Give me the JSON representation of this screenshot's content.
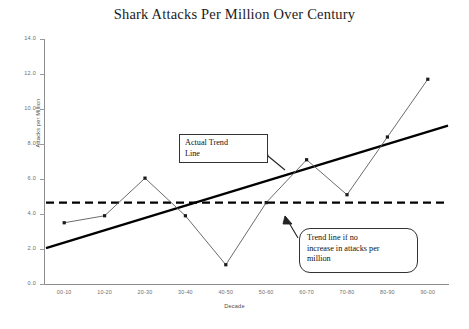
{
  "chart_data": {
    "type": "line",
    "title": "Shark Attacks Per Million Over Century",
    "xlabel": "Decade",
    "ylabel": "Attacks per Million",
    "categories": [
      "00-10",
      "10-20",
      "20-30",
      "30-40",
      "40-50",
      "50-60",
      "60-70",
      "70-80",
      "80-90",
      "90-00"
    ],
    "ylim": [
      0.0,
      14.0
    ],
    "ytick_labels": [
      "0.0",
      "2.0",
      "4.0",
      "6.0",
      "8.0",
      "10.0",
      "12.0",
      "14.0"
    ],
    "ytick_values": [
      0,
      2,
      4,
      6,
      8,
      10,
      12,
      14
    ],
    "grid": false,
    "legend": "none",
    "series": [
      {
        "name": "Attacks per million",
        "style": "line-with-markers",
        "values": [
          3.5,
          3.9,
          6.05,
          3.9,
          1.1,
          4.65,
          7.1,
          5.1,
          8.4,
          11.7
        ]
      },
      {
        "name": "Actual trend line",
        "style": "solid-thick",
        "values": [
          2.4,
          3.1,
          3.8,
          4.5,
          5.2,
          5.9,
          6.6,
          7.3,
          8.0,
          8.7
        ]
      },
      {
        "name": "Trend line if no increase in attacks per million",
        "style": "dashed-thick",
        "values": [
          4.65,
          4.65,
          4.65,
          4.65,
          4.65,
          4.65,
          4.65,
          4.65,
          4.65,
          4.65
        ]
      }
    ],
    "annotations": [
      {
        "id": "actual-trend",
        "text": "Actual Trend Line",
        "shape": "rectangle-callout"
      },
      {
        "id": "flat-trend",
        "text": "Trend line if no increase in attacks per million",
        "shape": "rounded-callout"
      }
    ]
  },
  "annotation_actual": {
    "line1": "Actual Trend",
    "line2": "Line"
  },
  "annotation_flat": {
    "line1": "Trend line if no",
    "line2": "increase in attacks per",
    "line3": "million"
  },
  "colors": {
    "data_line": "#5a5a5a",
    "trend_line": "#000000",
    "flat_line": "#000000",
    "axis": "#8d8d8d",
    "tick_text": "#6e6e6e",
    "title_text": "#1b1b1b"
  }
}
